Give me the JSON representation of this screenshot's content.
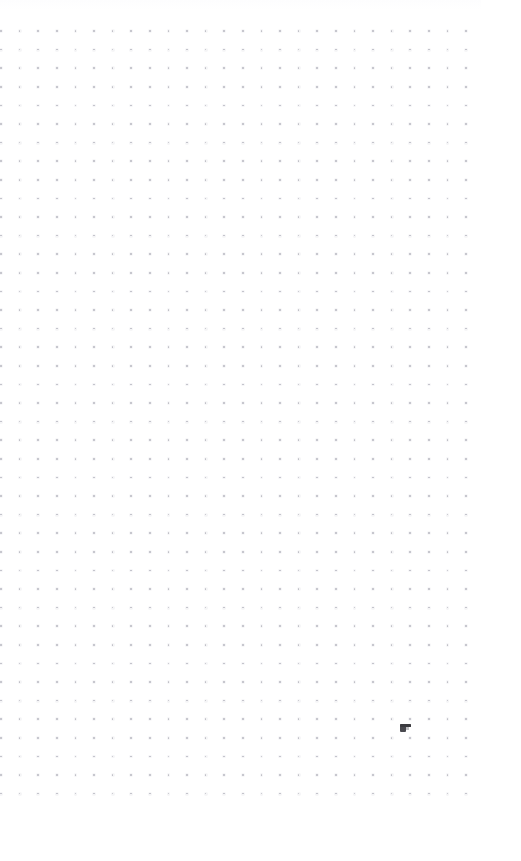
{
  "canvas": {
    "width": 521,
    "height": 861,
    "background_color": "#ffffff",
    "surface_name": "dot-grid-paper"
  },
  "grid": {
    "dot_color": "#b4b4bd",
    "dot_halo_color": "#c9c9d2",
    "dot_diameter_px": 1.6,
    "spacing_x_px": 18.6,
    "spacing_y_px": 18.6,
    "origin_x_px": 1,
    "origin_y_px": 31,
    "columns": 26,
    "rows": 42,
    "margin_top_px": 31,
    "margin_left_px": 1,
    "margin_right_px": 40,
    "margin_bottom_px": 59
  },
  "artifacts": {
    "pointer": {
      "label": "pointer-artifact",
      "x_px": 400,
      "y_px": 724,
      "width_px": 11,
      "height_px": 8,
      "color": "#3b3b3f"
    }
  },
  "top_band": {
    "height_px": 10,
    "color_start": "#fdfdfe",
    "color_end": "#ffffff"
  }
}
